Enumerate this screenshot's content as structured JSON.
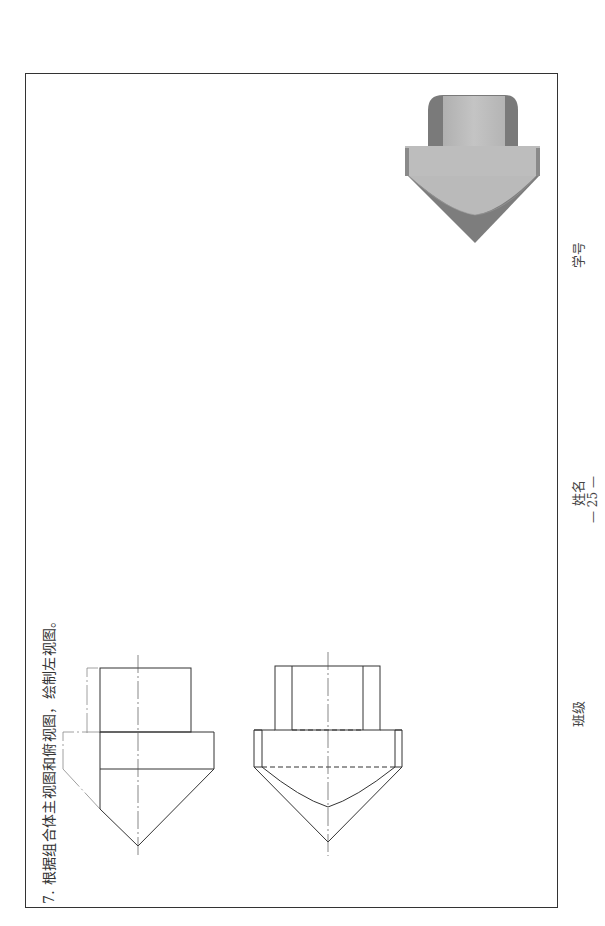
{
  "page": {
    "question": "7. 根据组合体主视图和俯视图，绘制左视图。",
    "footer": {
      "class_label": "班级",
      "name_label": "姓名",
      "id_label": "学号",
      "page_number": "— 25 —"
    }
  },
  "figures": [
    {
      "id": "front-view",
      "type": "orthographic-drawing",
      "description": "主视图"
    },
    {
      "id": "top-view",
      "type": "orthographic-drawing",
      "description": "俯视图"
    },
    {
      "id": "3d-model",
      "type": "shaded-3d-render",
      "description": "组合体立体图"
    }
  ],
  "colors": {
    "line": "#333333",
    "center_line": "#555555",
    "model_light": "#b8b8b8",
    "model_dark": "#7a7a7a"
  }
}
